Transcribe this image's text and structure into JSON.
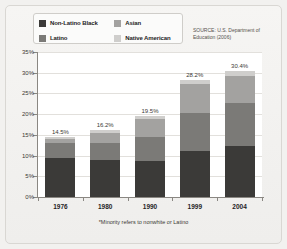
{
  "source_note": "SOURCE: U.S. Department of Education (2006)",
  "footnote": "*Minority refers to nonwhite or Latino",
  "legend": {
    "items": [
      {
        "label": "Non-Latino Black",
        "color": "#3b3a38"
      },
      {
        "label": "Latino",
        "color": "#7b7a77"
      },
      {
        "label": "Asian",
        "color": "#a3a2a0"
      },
      {
        "label": "Native American",
        "color": "#cfcecc"
      }
    ]
  },
  "chart_data": {
    "type": "bar",
    "title": "",
    "subtitle": "",
    "xlabel": "",
    "ylabel": "",
    "stacked": true,
    "grid": true,
    "legend_position": "top-left",
    "ylim": [
      0,
      35
    ],
    "ytick_labels": [
      "0%",
      "5%",
      "10%",
      "15%",
      "20%",
      "25%",
      "30%",
      "35%"
    ],
    "ytick_values": [
      0,
      5,
      10,
      15,
      20,
      25,
      30,
      35
    ],
    "categories": [
      "1976",
      "1980",
      "1990",
      "1999",
      "2004"
    ],
    "series": [
      {
        "name": "Non-Latino Black",
        "color": "#3b3a38",
        "values": [
          9.4,
          9.0,
          8.8,
          11.0,
          12.3
        ]
      },
      {
        "name": "Latino",
        "color": "#7b7a77",
        "values": [
          3.6,
          4.0,
          5.7,
          9.4,
          10.3
        ]
      },
      {
        "name": "Asian",
        "color": "#a3a2a0",
        "values": [
          1.0,
          2.4,
          4.4,
          6.8,
          6.6
        ]
      },
      {
        "name": "Native American",
        "color": "#cfcecc",
        "values": [
          0.5,
          0.8,
          0.6,
          1.0,
          1.2
        ]
      }
    ],
    "totals": [
      14.5,
      16.2,
      19.5,
      28.2,
      30.4
    ],
    "total_labels": [
      "14.5%",
      "16.2%",
      "19.5%",
      "28.2%",
      "30.4%"
    ]
  }
}
